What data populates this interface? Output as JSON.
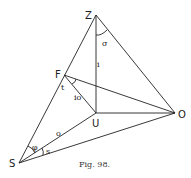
{
  "figure": {
    "caption": "Fig. 98.",
    "points": {
      "Z": {
        "label": "Z",
        "x": 96,
        "y": 15
      },
      "F": {
        "label": "F",
        "x": 64,
        "y": 75
      },
      "U": {
        "label": "U",
        "x": 96,
        "y": 113
      },
      "O": {
        "label": "O",
        "x": 175,
        "y": 113
      },
      "S": {
        "label": "S",
        "x": 19,
        "y": 163
      }
    },
    "segment_labels": {
      "ZU": "i",
      "FU": "io",
      "SU": "o"
    },
    "angle_labels": {
      "at_Z": "σ",
      "at_F": "t",
      "at_S_upper": "φ",
      "at_S_lower": "s"
    }
  }
}
